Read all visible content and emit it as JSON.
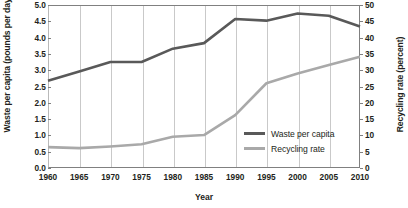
{
  "chart_data": {
    "type": "line",
    "title": "",
    "xlabel": "Year",
    "ylabel": "Waste per capita (pounds per day)",
    "ylabel_right": "Recycling rate (percent)",
    "x": [
      1960,
      1965,
      1970,
      1975,
      1980,
      1985,
      1990,
      1995,
      2000,
      2005,
      2010
    ],
    "xlim": [
      1960,
      2010
    ],
    "xticks": [
      "1960",
      "1965",
      "1970",
      "1975",
      "1980",
      "1985",
      "1990",
      "1995",
      "2000",
      "2005",
      "2010"
    ],
    "ylim": [
      0.0,
      5.0
    ],
    "yticks": [
      "0.0",
      "0.5",
      "1.0",
      "1.5",
      "2.0",
      "2.5",
      "3.0",
      "3.5",
      "4.0",
      "4.5",
      "5.0"
    ],
    "ylim_right": [
      0,
      50
    ],
    "yticks_right": [
      "0",
      "5",
      "10",
      "15",
      "20",
      "25",
      "30",
      "35",
      "40",
      "45",
      "50"
    ],
    "grid": "vertical",
    "legend_position": "inside-center-right",
    "series": [
      {
        "name": "Waste per capita",
        "axis": "left",
        "unit": "pounds per day",
        "color": "#595959",
        "values": [
          2.68,
          2.96,
          3.25,
          3.25,
          3.66,
          3.83,
          4.57,
          4.52,
          4.74,
          4.67,
          4.34
        ]
      },
      {
        "name": "Recycling rate",
        "axis": "right",
        "unit": "percent",
        "color": "#a9a9a9",
        "values": [
          6.4,
          6.1,
          6.6,
          7.3,
          9.6,
          10.1,
          16.2,
          26.0,
          29.0,
          31.6,
          34.1
        ]
      }
    ]
  },
  "legend": {
    "items": [
      {
        "label": "Waste per capita",
        "color": "#595959"
      },
      {
        "label": "Recycling rate",
        "color": "#a9a9a9"
      }
    ]
  }
}
